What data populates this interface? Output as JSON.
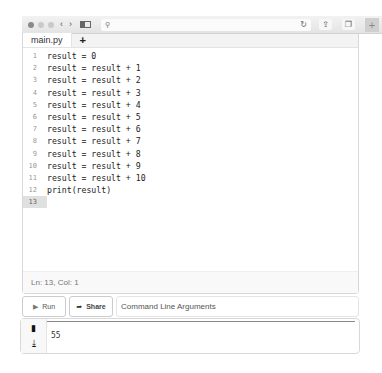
{
  "browser": {
    "back_glyph": "‹",
    "forward_glyph": "›",
    "search_glyph": "⚲",
    "reload_glyph": "↻",
    "share_glyph": "⇪",
    "tabs_glyph": "❐",
    "newtab_glyph": "+"
  },
  "editor": {
    "tabs": [
      {
        "label": "main.py"
      }
    ],
    "add_tab_label": "+",
    "lines": [
      {
        "n": "1",
        "code": "result = 0"
      },
      {
        "n": "2",
        "code": "result = result + 1"
      },
      {
        "n": "3",
        "code": "result = result + 2"
      },
      {
        "n": "4",
        "code": "result = result + 3"
      },
      {
        "n": "5",
        "code": "result = result + 4"
      },
      {
        "n": "6",
        "code": "result = result + 5"
      },
      {
        "n": "7",
        "code": "result = result + 6"
      },
      {
        "n": "8",
        "code": "result = result + 7"
      },
      {
        "n": "9",
        "code": "result = result + 8"
      },
      {
        "n": "10",
        "code": "result = result + 9"
      },
      {
        "n": "11",
        "code": "result = result + 10"
      },
      {
        "n": "12",
        "code": "print(result)"
      },
      {
        "n": "13",
        "code": ""
      }
    ],
    "status": "Ln: 13,  Col: 1"
  },
  "controls": {
    "run_glyph": "▶",
    "run_label": "Run",
    "share_glyph": "➦",
    "share_label": "Share",
    "args_placeholder": "Command Line Arguments"
  },
  "output": {
    "copy_glyph": "▮",
    "download_glyph": "⤓",
    "text": "55"
  }
}
